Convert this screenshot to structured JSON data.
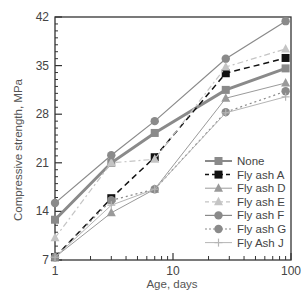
{
  "chart_data": {
    "type": "line",
    "title": "",
    "xlabel": "Age, days",
    "ylabel": "Compressive strength, MPa",
    "xscale": "log",
    "xlim": [
      1,
      100
    ],
    "ylim": [
      7,
      42
    ],
    "xticks": [
      1,
      10,
      100
    ],
    "xtick_labels": [
      "1",
      "10",
      "100"
    ],
    "yticks": [
      7,
      14,
      21,
      28,
      35,
      42
    ],
    "ytick_labels": [
      "7",
      "14",
      "21",
      "28",
      "35",
      "42"
    ],
    "grid": false,
    "legend_position": "lower right",
    "x": [
      1,
      3,
      7,
      28,
      90
    ],
    "series": [
      {
        "name": "None",
        "values": [
          12.8,
          21.0,
          25.3,
          31.5,
          34.6
        ],
        "marker": "square",
        "dash": "solid",
        "color": "#8a8a8a",
        "width": 3
      },
      {
        "name": "Fly ash A",
        "values": [
          7.4,
          15.9,
          21.8,
          33.9,
          36.1
        ],
        "marker": "square",
        "dash": "dashed",
        "color": "#111111",
        "width": 1.5
      },
      {
        "name": "Fly ash D",
        "values": [
          7.4,
          13.8,
          17.2,
          30.3,
          32.5
        ],
        "marker": "triangle",
        "dash": "solid",
        "color": "#9a9a9a",
        "width": 1
      },
      {
        "name": "Fly ash E",
        "values": [
          10.2,
          21.0,
          21.5,
          34.8,
          37.4
        ],
        "marker": "triangle",
        "dash": "dashdot",
        "color": "#c4c4c4",
        "width": 1.2
      },
      {
        "name": "Fly ash F",
        "values": [
          15.2,
          22.1,
          27.0,
          36.0,
          41.4
        ],
        "marker": "circle",
        "dash": "solid",
        "color": "#8a8a8a",
        "width": 1.2
      },
      {
        "name": "Fly ash G",
        "values": [
          7.4,
          15.6,
          17.2,
          28.3,
          31.3
        ],
        "marker": "circle",
        "dash": "dotted",
        "color": "#8a8a8a",
        "width": 1.2
      },
      {
        "name": "Fly Ash J",
        "values": [
          7.4,
          14.9,
          17.2,
          28.2,
          30.5
        ],
        "marker": "plus",
        "dash": "solid",
        "color": "#b5b5b5",
        "width": 1
      }
    ]
  }
}
